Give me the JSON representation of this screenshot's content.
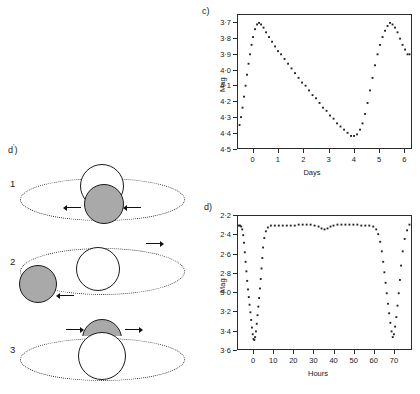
{
  "panels": {
    "c_label": "c)",
    "d_label": "d)",
    "dprime_label": "d",
    "dprime_prime": "'",
    "dprime_paren": ")"
  },
  "diagrams": {
    "title": "d')",
    "items": [
      {
        "number": "1",
        "description": "secondary-in-front-transit",
        "primary_color": "#ffffff",
        "secondary_color": "#a9a9a9",
        "arrows": [
          "left",
          "right"
        ]
      },
      {
        "number": "2",
        "description": "secondary-beside-primary-out-of-eclipse",
        "primary_color": "#ffffff",
        "secondary_color": "#a9a9a9",
        "arrows": [
          "left",
          "right"
        ]
      },
      {
        "number": "3",
        "description": "secondary-behind-primary-occultation",
        "primary_color": "#ffffff",
        "secondary_color": "#a9a9a9",
        "arrows": [
          "right",
          "right"
        ]
      }
    ]
  },
  "chart_data": [
    {
      "id": "chart-c",
      "type": "scatter",
      "title": "c)",
      "xlabel": "Days",
      "ylabel": "Mag",
      "xlim": [
        -0.62,
        6.3
      ],
      "ylim": [
        4.5,
        3.65
      ],
      "y_inverted": true,
      "grid": false,
      "legend": null,
      "xticks": [
        0,
        1,
        2,
        3,
        4,
        5,
        6
      ],
      "xticklabels": [
        "0",
        "1",
        "2",
        "3",
        "4",
        "5",
        "6"
      ],
      "yticks": [
        3.7,
        3.8,
        3.9,
        4.0,
        4.1,
        4.2,
        4.3,
        4.4,
        4.5
      ],
      "yticklabels": [
        "3·7",
        "3·8",
        "3·9",
        "4·0",
        "4·1",
        "4·2",
        "4·3",
        "4·4",
        "4·5"
      ],
      "x": [
        -0.56,
        -0.5,
        -0.44,
        -0.38,
        -0.32,
        -0.26,
        -0.2,
        -0.14,
        -0.08,
        -0.02,
        0.06,
        0.14,
        0.22,
        0.3,
        0.4,
        0.5,
        0.62,
        0.74,
        0.86,
        0.98,
        1.1,
        1.24,
        1.38,
        1.52,
        1.66,
        1.8,
        1.94,
        2.08,
        2.22,
        2.36,
        2.5,
        2.64,
        2.78,
        2.92,
        3.06,
        3.2,
        3.34,
        3.48,
        3.62,
        3.76,
        3.9,
        4.02,
        4.14,
        4.26,
        4.36,
        4.46,
        4.56,
        4.66,
        4.76,
        4.86,
        4.96,
        5.06,
        5.16,
        5.26,
        5.36,
        5.46,
        5.56,
        5.66,
        5.76,
        5.86,
        5.96,
        6.06,
        6.16,
        6.24
      ],
      "y": [
        4.35,
        4.3,
        4.24,
        4.17,
        4.1,
        4.03,
        3.96,
        3.9,
        3.84,
        3.79,
        3.74,
        3.71,
        3.7,
        3.71,
        3.73,
        3.76,
        3.79,
        3.82,
        3.85,
        3.88,
        3.9,
        3.93,
        3.96,
        3.99,
        4.02,
        4.05,
        4.08,
        4.1,
        4.13,
        4.16,
        4.18,
        4.21,
        4.24,
        4.26,
        4.29,
        4.31,
        4.34,
        4.36,
        4.38,
        4.4,
        4.42,
        4.42,
        4.41,
        4.38,
        4.34,
        4.28,
        4.21,
        4.13,
        4.05,
        3.97,
        3.9,
        3.84,
        3.79,
        3.75,
        3.72,
        3.7,
        3.71,
        3.73,
        3.76,
        3.8,
        3.84,
        3.87,
        3.9,
        3.9
      ]
    },
    {
      "id": "chart-d",
      "type": "scatter",
      "title": "d)",
      "xlabel": "Hours",
      "ylabel": "Mag",
      "xlim": [
        -8,
        79
      ],
      "ylim": [
        3.6,
        2.2
      ],
      "y_inverted": true,
      "grid": false,
      "legend": null,
      "xticks": [
        0,
        10,
        20,
        30,
        40,
        50,
        60,
        70
      ],
      "xticklabels": [
        "0",
        "10",
        "20",
        "30",
        "40",
        "50",
        "60",
        "70"
      ],
      "yticks": [
        2.2,
        2.4,
        2.6,
        2.8,
        3.0,
        3.2,
        3.4,
        3.6
      ],
      "yticklabels": [
        "2·2",
        "2·4",
        "2·6",
        "2·8",
        "3·0",
        "3·2",
        "3·4",
        "3·6"
      ],
      "x": [
        -7.6,
        -7.0,
        -6.4,
        -5.9,
        -5.4,
        -5.0,
        -4.6,
        -4.2,
        -3.8,
        -3.4,
        -3.0,
        -2.6,
        -2.2,
        -1.8,
        -1.4,
        -1.0,
        -0.6,
        -0.2,
        0.2,
        0.6,
        1.0,
        1.4,
        1.8,
        2.2,
        2.6,
        3.0,
        3.4,
        3.8,
        4.2,
        4.6,
        5.2,
        6.0,
        7.0,
        8.5,
        10.5,
        12.5,
        14.5,
        16.5,
        18.5,
        20.5,
        22.5,
        24.5,
        26.5,
        28.5,
        30.5,
        32.5,
        34.0,
        35.5,
        37.0,
        38.5,
        40.0,
        42.0,
        44.0,
        46.0,
        48.0,
        50.0,
        52.0,
        54.0,
        56.0,
        58.0,
        60.0,
        61.5,
        62.5,
        63.5,
        64.3,
        65.0,
        65.6,
        66.2,
        66.8,
        67.4,
        68.0,
        68.6,
        69.2,
        69.8,
        70.4,
        71.0,
        71.6,
        72.2,
        72.8,
        73.4,
        74.0,
        74.8,
        75.8,
        77.0,
        78.2
      ],
      "y": [
        2.3,
        2.3,
        2.31,
        2.34,
        2.4,
        2.48,
        2.58,
        2.68,
        2.78,
        2.88,
        2.97,
        3.05,
        3.13,
        3.21,
        3.29,
        3.37,
        3.44,
        3.49,
        3.5,
        3.47,
        3.41,
        3.33,
        3.24,
        3.15,
        3.06,
        2.96,
        2.86,
        2.75,
        2.64,
        2.53,
        2.43,
        2.36,
        2.32,
        2.3,
        2.3,
        2.3,
        2.3,
        2.3,
        2.3,
        2.3,
        2.29,
        2.29,
        2.29,
        2.29,
        2.3,
        2.31,
        2.33,
        2.34,
        2.33,
        2.31,
        2.3,
        2.29,
        2.29,
        2.29,
        2.29,
        2.29,
        2.29,
        2.3,
        2.3,
        2.3,
        2.31,
        2.34,
        2.39,
        2.47,
        2.57,
        2.68,
        2.79,
        2.9,
        3.01,
        3.12,
        3.22,
        3.32,
        3.41,
        3.47,
        3.44,
        3.36,
        3.26,
        3.14,
        3.01,
        2.87,
        2.72,
        2.57,
        2.44,
        2.35,
        2.29
      ]
    }
  ]
}
